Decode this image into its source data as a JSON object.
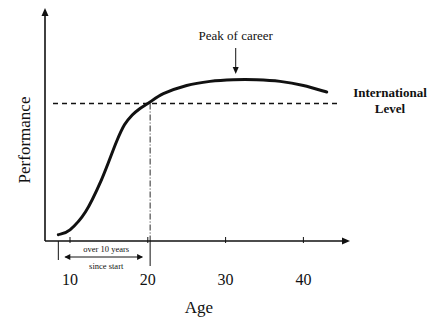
{
  "chart_data": {
    "type": "line",
    "title": "",
    "xlabel": "Age",
    "ylabel": "Performance",
    "xlim": [
      5,
      47
    ],
    "ylim": [
      0,
      100
    ],
    "x_ticks": [
      10,
      20,
      30,
      40
    ],
    "x_tick_labels": [
      "10",
      "20",
      "30",
      "40"
    ],
    "grid": false,
    "series": [
      {
        "name": "Performance curve",
        "x": [
          8.5,
          10,
          12,
          14,
          16,
          17,
          18,
          19,
          20,
          22,
          25,
          28,
          31,
          34,
          37,
          40,
          43
        ],
        "y": [
          2,
          5,
          16,
          35,
          59,
          69,
          75,
          79,
          82,
          88,
          93,
          95.5,
          96.5,
          96.5,
          95.5,
          93,
          89
        ]
      }
    ],
    "reference_lines": [
      {
        "type": "horizontal",
        "y": 82,
        "style": "dashed",
        "label": "International Level",
        "label_lines": [
          "International",
          "Level"
        ]
      },
      {
        "type": "vertical",
        "x": 20.3,
        "style": "dash-dot"
      }
    ],
    "annotations": [
      {
        "text": "Peak of career",
        "x": 31.3,
        "y": 96.5,
        "arrow": "down"
      },
      {
        "text": "over 10 years",
        "span": [
          8.5,
          20.3
        ]
      },
      {
        "text": "since start",
        "span": [
          8.5,
          20.3
        ]
      }
    ]
  }
}
